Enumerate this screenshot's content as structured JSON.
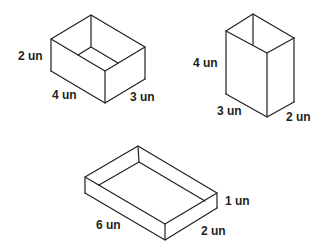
{
  "figures": [
    {
      "name": "box-a",
      "dimensions": {
        "length": "4 un",
        "width": "3 un",
        "height": "2 un"
      },
      "labels": {
        "height": "2 un",
        "length": "4 un",
        "width": "3 un"
      }
    },
    {
      "name": "box-b",
      "dimensions": {
        "length": "3 un",
        "width": "2 un",
        "height": "4 un"
      },
      "labels": {
        "height": "4 un",
        "length": "3 un",
        "width": "2 un"
      }
    },
    {
      "name": "box-c",
      "dimensions": {
        "length": "6 un",
        "width": "2 un",
        "height": "1 un"
      },
      "labels": {
        "height": "1 un",
        "length": "6 un",
        "width": "2 un"
      }
    }
  ],
  "colors": {
    "line": "#231f20",
    "background": "#ffffff"
  }
}
